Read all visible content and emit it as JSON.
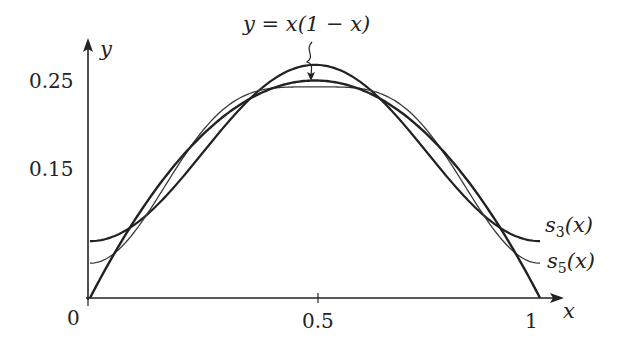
{
  "chart_data": {
    "type": "line",
    "title": "",
    "xlabel": "x",
    "ylabel": "y",
    "xlim": [
      0,
      1
    ],
    "ylim": [
      0,
      0.25
    ],
    "x_ticks": [
      {
        "value": 0,
        "label": "0"
      },
      {
        "value": 0.5,
        "label": "0.5"
      },
      {
        "value": 1,
        "label": "1"
      }
    ],
    "y_ticks": [
      {
        "value": 0.15,
        "label": "0.15"
      },
      {
        "value": 0.25,
        "label": "0.25"
      }
    ],
    "grid": false,
    "legend": "inline labels at right end of curves",
    "annotations": [
      {
        "text": "y = x(1 − x)",
        "points_to": [
          0.5,
          0.25
        ]
      }
    ],
    "series": [
      {
        "name": "y = x(1 − x)",
        "formula": "x*(1-x)",
        "x": [
          0,
          0.1,
          0.2,
          0.3,
          0.4,
          0.5,
          0.6,
          0.7,
          0.8,
          0.9,
          1
        ],
        "values": [
          0,
          0.09,
          0.16,
          0.21,
          0.24,
          0.25,
          0.24,
          0.21,
          0.16,
          0.09,
          0
        ]
      },
      {
        "name": "s3(x)",
        "formula": "1/6 - cos(2πx)/π²",
        "x": [
          0,
          0.1,
          0.2,
          0.3,
          0.4,
          0.5,
          0.6,
          0.7,
          0.8,
          0.9,
          1
        ],
        "values": [
          0.065,
          0.085,
          0.135,
          0.198,
          0.249,
          0.268,
          0.249,
          0.198,
          0.135,
          0.085,
          0.065
        ]
      },
      {
        "name": "s5(x)",
        "formula": "1/6 - cos(2πx)/π² - cos(4πx)/(4π²)",
        "x": [
          0,
          0.1,
          0.2,
          0.3,
          0.4,
          0.5,
          0.6,
          0.7,
          0.8,
          0.9,
          1
        ],
        "values": [
          0.04,
          0.077,
          0.155,
          0.219,
          0.229,
          0.243,
          0.229,
          0.219,
          0.155,
          0.077,
          0.04
        ]
      }
    ]
  },
  "labels": {
    "y_axis": "y",
    "x_axis": "x",
    "origin": "0",
    "tick_half": "0.5",
    "tick_one": "1",
    "tick_025": "0.25",
    "tick_015": "0.15",
    "annotation": "y = x(1 − x)",
    "s3_main": "s",
    "s3_sub": "3",
    "s3_arg": "(x)",
    "s5_main": "s",
    "s5_sub": "5",
    "s5_arg": "(x)"
  },
  "colors": {
    "ink": "#222222",
    "thin_curve": "#3a3a3a"
  }
}
